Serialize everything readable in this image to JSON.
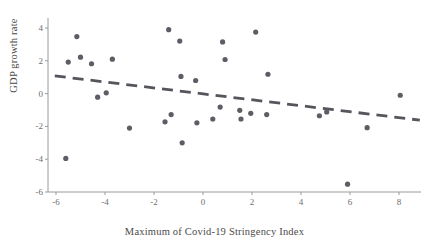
{
  "chart_data": {
    "type": "scatter",
    "title": "",
    "xlabel": "Maximum of Covid-19 Stringency Index",
    "ylabel": "GDP growth rate",
    "xlim": [
      -6.4,
      8.9
    ],
    "ylim": [
      -6.0,
      4.6
    ],
    "xticks": [
      -6,
      -4,
      -2,
      0,
      2,
      4,
      6,
      8
    ],
    "xtick_labels": [
      "-6",
      "-4",
      "-2",
      "0",
      "2",
      "4",
      "6",
      "8"
    ],
    "yticks": [
      4,
      2,
      0,
      -2,
      -4,
      -6
    ],
    "ytick_labels": [
      "4",
      "2",
      "0",
      "-2",
      "-4",
      "-6"
    ],
    "grid": false,
    "legend": null,
    "marker_color": "#5d5d66",
    "marker_size": 2.6,
    "points": [
      {
        "x": -5.6,
        "y": -3.95
      },
      {
        "x": -5.5,
        "y": 1.92
      },
      {
        "x": -5.15,
        "y": 3.48
      },
      {
        "x": -5.0,
        "y": 2.22
      },
      {
        "x": -4.55,
        "y": 1.82
      },
      {
        "x": -4.3,
        "y": -0.22
      },
      {
        "x": -3.95,
        "y": 0.05
      },
      {
        "x": -3.7,
        "y": 2.1
      },
      {
        "x": -3.0,
        "y": -2.1
      },
      {
        "x": -1.55,
        "y": -1.72
      },
      {
        "x": -1.4,
        "y": 3.9
      },
      {
        "x": -1.3,
        "y": -1.28
      },
      {
        "x": -0.95,
        "y": 3.2
      },
      {
        "x": -0.9,
        "y": 1.05
      },
      {
        "x": -0.85,
        "y": -3.0
      },
      {
        "x": -0.3,
        "y": 0.8
      },
      {
        "x": -0.25,
        "y": -1.78
      },
      {
        "x": 0.4,
        "y": -1.55
      },
      {
        "x": 0.7,
        "y": -0.82
      },
      {
        "x": 0.8,
        "y": 3.15
      },
      {
        "x": 0.9,
        "y": 2.08
      },
      {
        "x": 1.5,
        "y": -1.02
      },
      {
        "x": 1.55,
        "y": -1.55
      },
      {
        "x": 1.95,
        "y": -1.2
      },
      {
        "x": 2.15,
        "y": 3.75
      },
      {
        "x": 2.6,
        "y": -1.28
      },
      {
        "x": 2.65,
        "y": 1.18
      },
      {
        "x": 4.75,
        "y": -1.35
      },
      {
        "x": 5.05,
        "y": -1.12
      },
      {
        "x": 5.9,
        "y": -5.52
      },
      {
        "x": 6.7,
        "y": -2.08
      },
      {
        "x": 8.05,
        "y": -0.1
      }
    ],
    "trendline": {
      "style": "dashed",
      "color": "#55555c",
      "x_start": -6.05,
      "y_start": 1.08,
      "x_end": 8.85,
      "y_end": -1.62
    }
  }
}
